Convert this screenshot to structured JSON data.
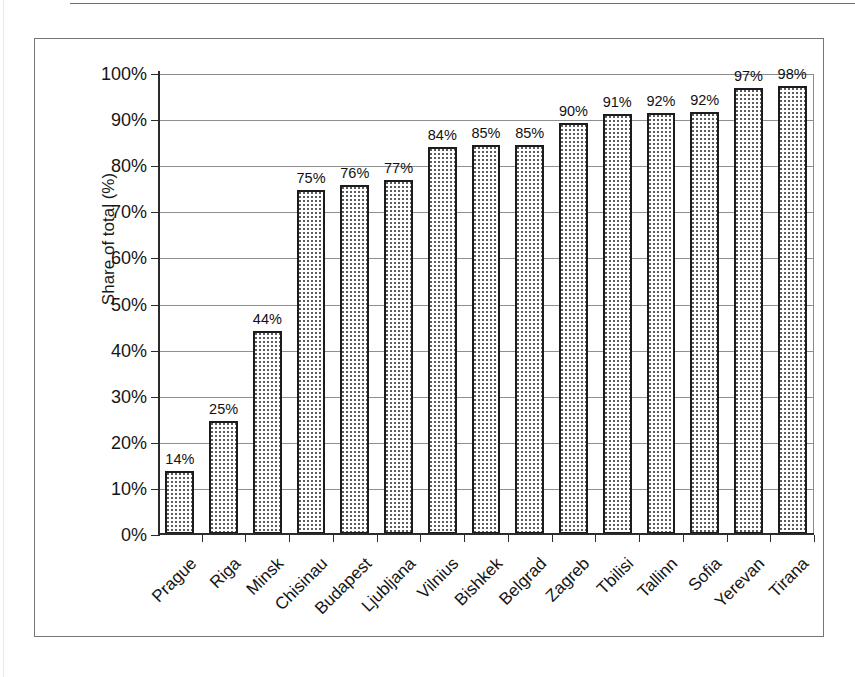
{
  "chart_data": {
    "type": "bar",
    "title": "",
    "subtitle": "",
    "xlabel": "",
    "ylabel": "Share of total (%)",
    "ylim": [
      0,
      100
    ],
    "y_ticks": [
      "0%",
      "10%",
      "20%",
      "30%",
      "40%",
      "50%",
      "60%",
      "70%",
      "80%",
      "90%",
      "100%"
    ],
    "y_tick_values": [
      0,
      10,
      20,
      30,
      40,
      50,
      60,
      70,
      80,
      90,
      100
    ],
    "grid": true,
    "legend": null,
    "legend_position": "none",
    "categories": [
      "Prague",
      "Riga",
      "Minsk",
      "Chisinau",
      "Budapest",
      "Ljubljana",
      "Vilnius",
      "Bishkek",
      "Belgrad",
      "Zagreb",
      "Tbilisi",
      "Tallinn",
      "Sofia",
      "Yerevan",
      "Tirana"
    ],
    "values": [
      14,
      25,
      44,
      75,
      76,
      77,
      84,
      85,
      85,
      90,
      91,
      92,
      92,
      97,
      98
    ],
    "bar_heights_pct": [
      13.6,
      24.6,
      44.0,
      74.7,
      75.8,
      76.7,
      84.0,
      84.3,
      84.3,
      89.2,
      91.1,
      91.3,
      91.6,
      96.8,
      97.2
    ],
    "data_labels": [
      "14%",
      "25%",
      "44%",
      "75%",
      "76%",
      "77%",
      "84%",
      "85%",
      "85%",
      "90%",
      "91%",
      "92%",
      "92%",
      "97%",
      "98%"
    ],
    "colors": {
      "bar_fill": "#ffffff",
      "bar_pattern_dots": "#5d5d5d",
      "bar_border": "#1c1c1c",
      "gridline": "#8f8f8f",
      "axis": "#2b2b2b",
      "frame": "#767676",
      "text": "#141414"
    }
  }
}
